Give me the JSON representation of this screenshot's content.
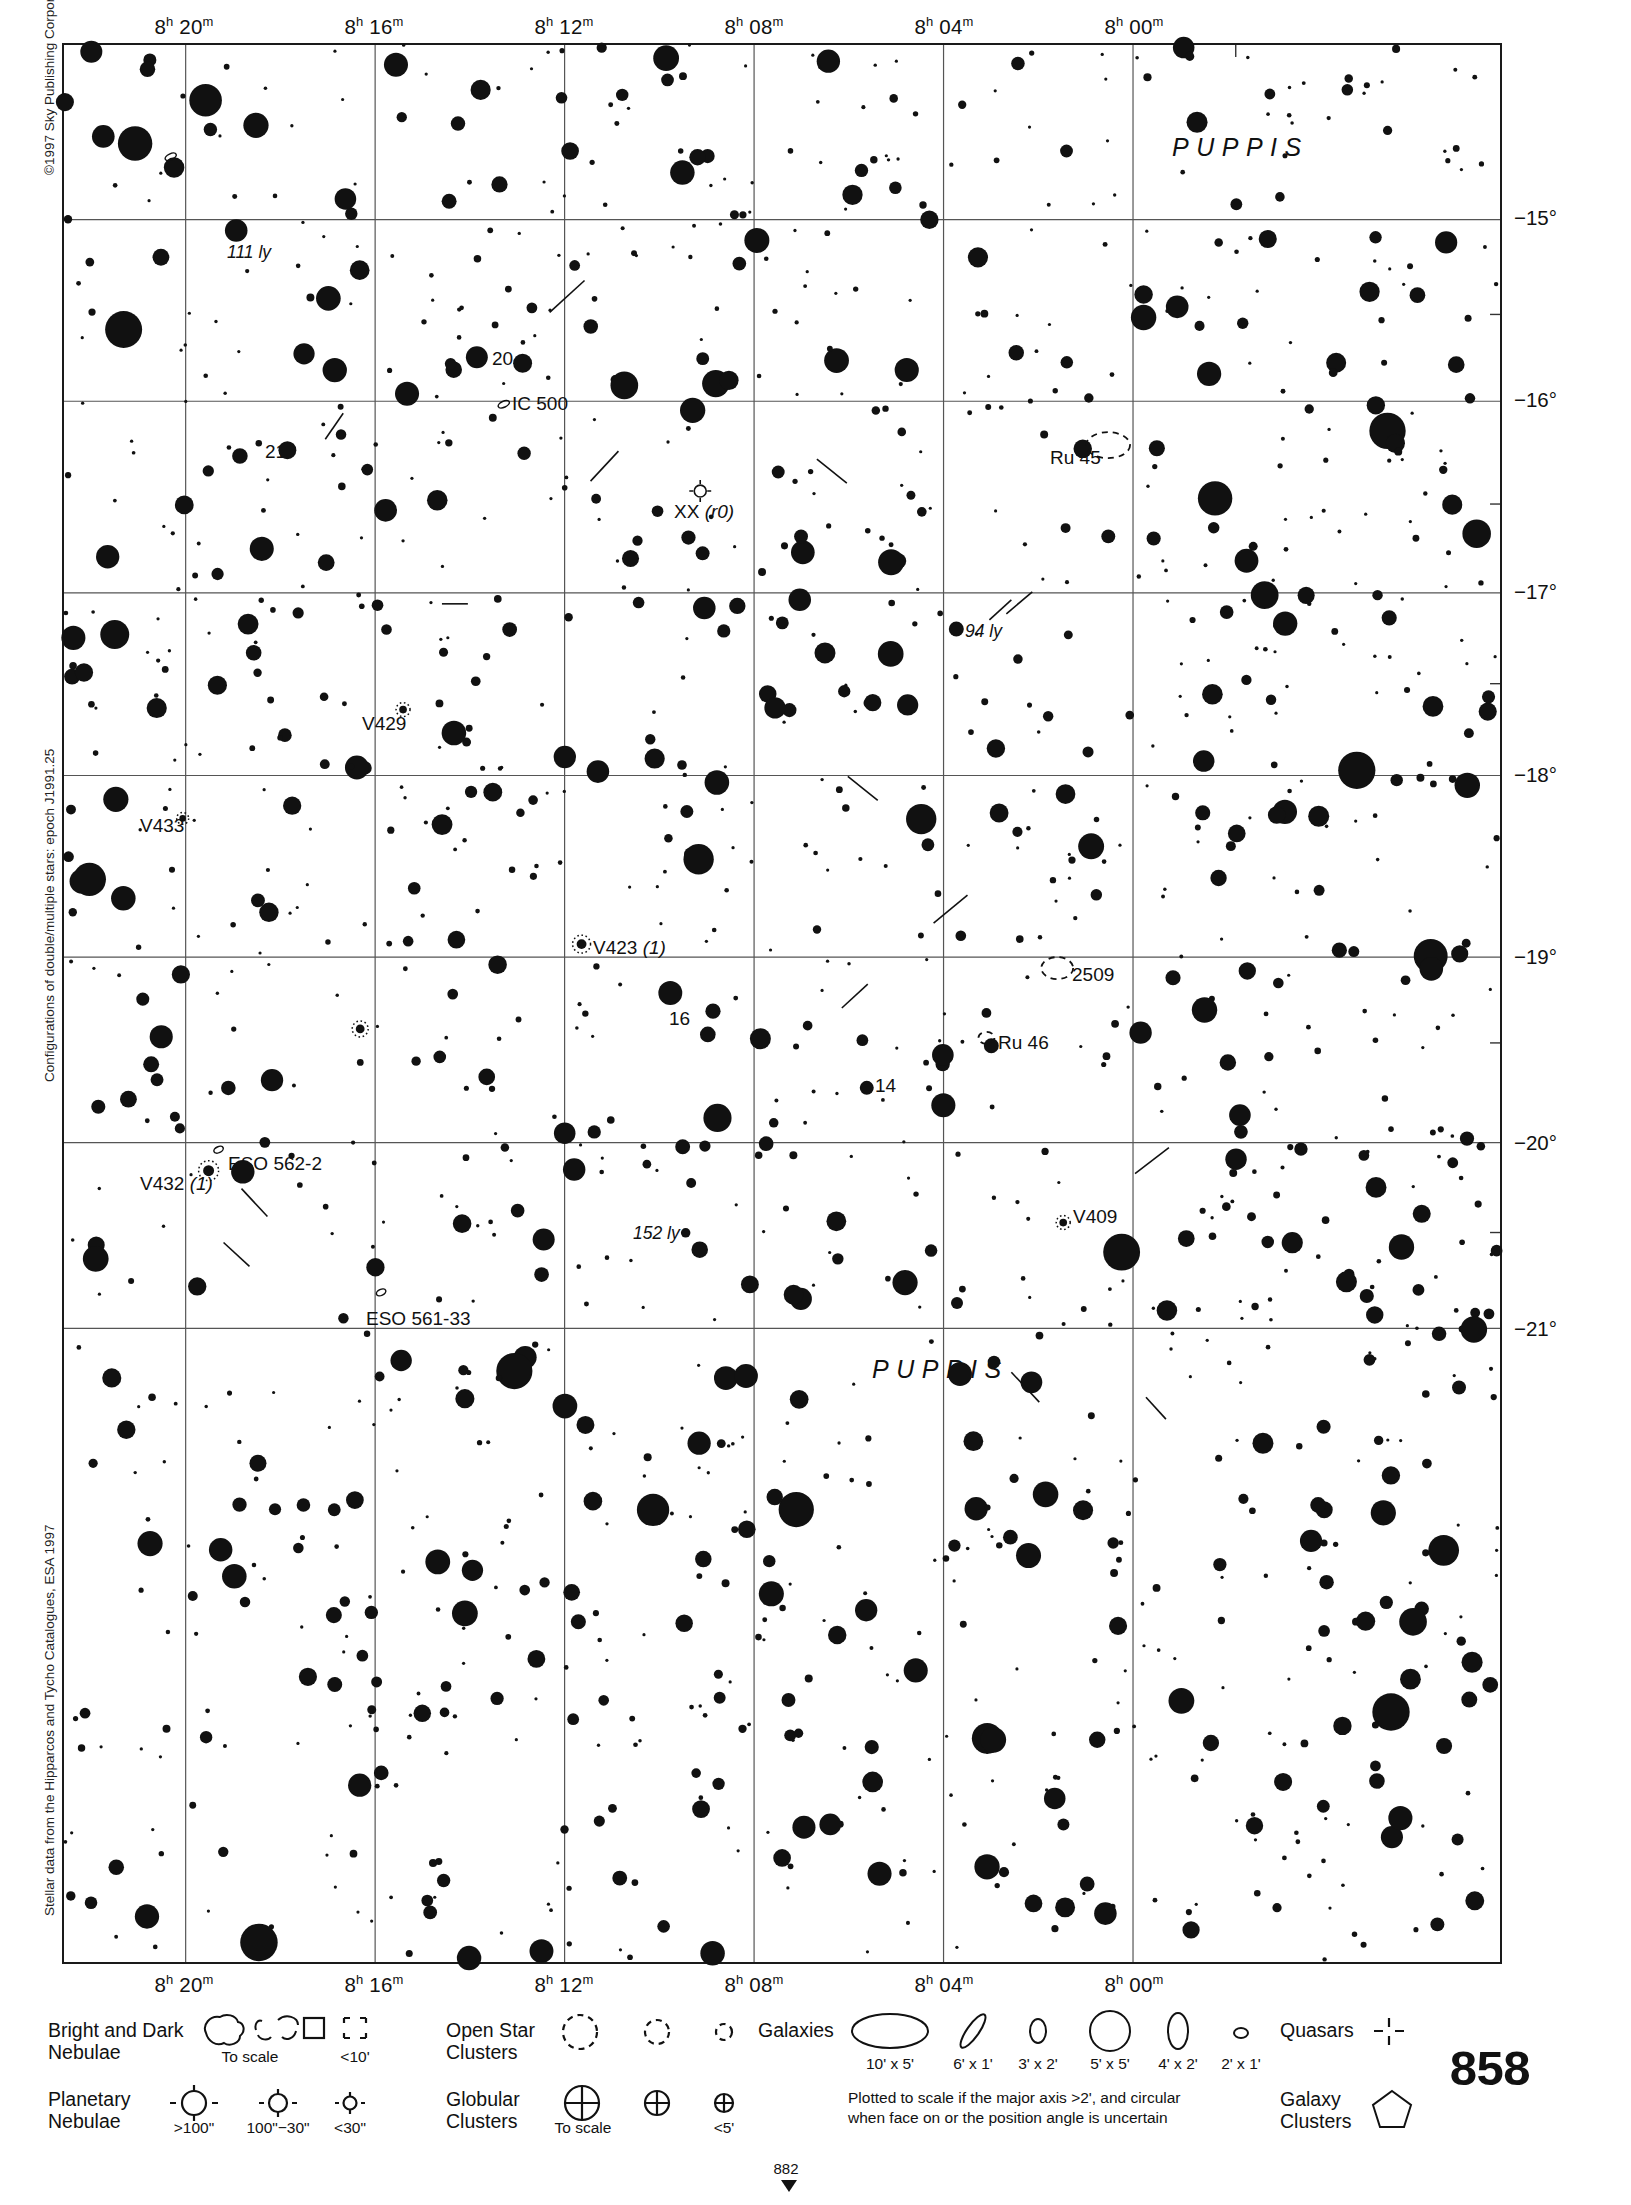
{
  "page": {
    "number": "858",
    "continuation_number": "882",
    "copyright": "©1997 Sky Publishing Corporation",
    "config_note": "Configurations of double/multiple stars: epoch J1991.25",
    "data_source": "Stellar data from the Hipparcos and Tycho Catalogues, ESA 1997"
  },
  "axes": {
    "ra_ticks": [
      {
        "label": "8h 20m",
        "hour": "8",
        "sup1": "h",
        "min": "20",
        "sup2": "m",
        "x": 122
      },
      {
        "label": "8h 16m",
        "hour": "8",
        "sup1": "h",
        "min": "16",
        "sup2": "m",
        "x": 312
      },
      {
        "label": "8h 12m",
        "hour": "8",
        "sup1": "h",
        "min": "12",
        "sup2": "m",
        "x": 502
      },
      {
        "label": "8h 08m",
        "hour": "8",
        "sup1": "h",
        "min": "08",
        "sup2": "m",
        "x": 692
      },
      {
        "label": "8h 04m",
        "hour": "8",
        "sup1": "h",
        "min": "04",
        "sup2": "m",
        "x": 882
      },
      {
        "label": "8h 00m",
        "hour": "8",
        "sup1": "h",
        "min": "00",
        "sup2": "m",
        "x": 1072
      }
    ],
    "dec_ticks": [
      {
        "label": "−15°",
        "y": 175
      },
      {
        "label": "−16°",
        "y": 357
      },
      {
        "label": "−17°",
        "y": 549
      },
      {
        "label": "−18°",
        "y": 732
      },
      {
        "label": "−19°",
        "y": 914
      },
      {
        "label": "−20°",
        "y": 1100
      },
      {
        "label": "−21°",
        "y": 1286
      }
    ]
  },
  "constellations": [
    {
      "name": "PUPPIS",
      "x": 1110,
      "y": 90
    },
    {
      "name": "PUPPIS",
      "x": 810,
      "y": 1312
    }
  ],
  "object_labels": [
    {
      "text": "111 ly",
      "x": 165,
      "y": 199,
      "style": "ital"
    },
    {
      "text": "20",
      "x": 430,
      "y": 305,
      "style": "plain"
    },
    {
      "text": "IC 500",
      "x": 450,
      "y": 350,
      "style": "plain"
    },
    {
      "text": "21",
      "x": 203,
      "y": 398,
      "style": "plain"
    },
    {
      "text": "Ru 45",
      "x": 988,
      "y": 404,
      "style": "plain"
    },
    {
      "text": "XX (r0)",
      "x": 612,
      "y": 458,
      "style": "mixed"
    },
    {
      "text": "94 ly",
      "x": 903,
      "y": 578,
      "style": "ital"
    },
    {
      "text": "V429",
      "x": 300,
      "y": 670,
      "style": "plain"
    },
    {
      "text": "V433",
      "x": 78,
      "y": 772,
      "style": "plain"
    },
    {
      "text": "V423 (1)",
      "x": 531,
      "y": 894,
      "style": "mixed"
    },
    {
      "text": "2509",
      "x": 1010,
      "y": 921,
      "style": "plain"
    },
    {
      "text": "16",
      "x": 607,
      "y": 965,
      "style": "plain"
    },
    {
      "text": "Ru 46",
      "x": 936,
      "y": 989,
      "style": "plain"
    },
    {
      "text": "14",
      "x": 813,
      "y": 1032,
      "style": "plain"
    },
    {
      "text": "ESO 562-2",
      "x": 166,
      "y": 1110,
      "style": "plain"
    },
    {
      "text": "V432 (1)",
      "x": 78,
      "y": 1130,
      "style": "mixed"
    },
    {
      "text": "V409",
      "x": 1011,
      "y": 1163,
      "style": "plain"
    },
    {
      "text": "152 ly",
      "x": 571,
      "y": 1180,
      "style": "ital"
    },
    {
      "text": "ESO 561-33",
      "x": 304,
      "y": 1265,
      "style": "plain"
    }
  ],
  "legend": {
    "bright_dark_nebulae": {
      "title_line1": "Bright and Dark",
      "title_line2": "Nebulae",
      "sub_to_scale": "To scale",
      "sub_small": "<10'"
    },
    "planetary_nebulae": {
      "title_line1": "Planetary",
      "title_line2": "Nebulae",
      "sizes": [
        ">100\"",
        "100\"−30\"",
        "<30\""
      ]
    },
    "open_star_clusters": {
      "title_line1": "Open Star",
      "title_line2": "Clusters"
    },
    "globular_clusters": {
      "title_line1": "Globular",
      "title_line2": "Clusters",
      "sub_to_scale": "To scale",
      "sub_small": "<5'"
    },
    "galaxies": {
      "title": "Galaxies",
      "sizes": [
        "10' x 5'",
        "6' x 1'",
        "3' x 2'",
        "5' x 5'",
        "4' x 2'",
        "2' x 1'"
      ],
      "note_line1": "Plotted to scale if the major axis >2', and circular",
      "note_line2": "when face on or the position angle is uncertain"
    },
    "quasars": {
      "title": "Quasars"
    },
    "galaxy_clusters": {
      "title_line1": "Galaxy",
      "title_line2": "Clusters"
    }
  },
  "chart_data": {
    "type": "scatter",
    "xlabel": "Right Ascension",
    "ylabel": "Declination",
    "xlim": [
      "8h 21m",
      "7h 59m"
    ],
    "ylim": [
      -21.5,
      -14.4
    ],
    "grid": true,
    "ra_gridlines_px": [
      122,
      312,
      502,
      692,
      882,
      1072
    ],
    "dec_gridlines_px": [
      175,
      357,
      549,
      732,
      914,
      1100,
      1286
    ],
    "stars_seed": 20250858,
    "star_count": 1450,
    "magnitude_scale": {
      "largest_px": 13,
      "smallest_px": 1.6
    },
    "notable_stars": [
      {
        "name": "20",
        "x": 414,
        "y": 313,
        "r": 11
      },
      {
        "name": "21",
        "x": 224,
        "y": 406,
        "r": 9
      },
      {
        "name": "16",
        "x": 608,
        "y": 950,
        "r": 12
      },
      {
        "name": "14",
        "x": 805,
        "y": 1045,
        "r": 7
      },
      {
        "name": "bright-right-edge",
        "x": 1030,
        "y": 803,
        "r": 13
      }
    ],
    "deep_sky_objects": [
      {
        "type": "open-cluster",
        "name": "Ru 45",
        "x": 1047,
        "y": 401,
        "rx": 22,
        "ry": 13
      },
      {
        "type": "open-cluster",
        "name": "2509",
        "x": 996,
        "y": 925,
        "rx": 16,
        "ry": 11
      },
      {
        "type": "open-cluster",
        "name": "Ru 46",
        "x": 925,
        "y": 995,
        "rx": 8,
        "ry": 6
      },
      {
        "type": "variable",
        "name": "V429",
        "x": 340,
        "y": 666,
        "r": 7
      },
      {
        "type": "variable",
        "name": "V433",
        "x": 119,
        "y": 775,
        "r": 6
      },
      {
        "type": "variable",
        "name": "V423",
        "x": 519,
        "y": 901,
        "r": 9
      },
      {
        "type": "variable",
        "name": "V432",
        "x": 145,
        "y": 1128,
        "r": 10
      },
      {
        "type": "variable",
        "name": "V409",
        "x": 1002,
        "y": 1180,
        "r": 7
      },
      {
        "type": "variable",
        "name": "unnamed",
        "x": 297,
        "y": 986,
        "r": 8
      },
      {
        "type": "planetary",
        "name": "XX (r0)",
        "x": 638,
        "y": 447,
        "r": 6
      },
      {
        "type": "galaxy",
        "name": "IC 500",
        "x": 441,
        "y": 360,
        "rx": 6,
        "ry": 3
      },
      {
        "type": "galaxy",
        "name": "ESO 562-2",
        "x": 155,
        "y": 1107,
        "rx": 5,
        "ry": 3
      },
      {
        "type": "galaxy",
        "name": "ESO 561-33",
        "x": 318,
        "y": 1250,
        "rx": 5,
        "ry": 3
      },
      {
        "type": "galaxy",
        "name": "anon",
        "x": 107,
        "y": 112,
        "rx": 6,
        "ry": 3
      }
    ]
  }
}
